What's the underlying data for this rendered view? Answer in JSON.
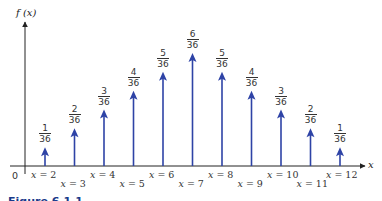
{
  "chart_data": {
    "type": "bar",
    "subtype": "stem-arrow",
    "title": "",
    "xlabel": "x",
    "ylabel": "f (x)",
    "origin_label": "0",
    "categories": [
      "x = 2",
      "x = 3",
      "x = 4",
      "x = 5",
      "x = 6",
      "x = 7",
      "x = 8",
      "x = 9",
      "x = 10",
      "x = 11",
      "x = 12"
    ],
    "x": [
      2,
      3,
      4,
      5,
      6,
      7,
      8,
      9,
      10,
      11,
      12
    ],
    "values": [
      0.02778,
      0.05556,
      0.08333,
      0.11111,
      0.13889,
      0.16667,
      0.13889,
      0.11111,
      0.08333,
      0.05556,
      0.02778
    ],
    "value_labels": [
      {
        "num": "1",
        "den": "36"
      },
      {
        "num": "2",
        "den": "36"
      },
      {
        "num": "3",
        "den": "36"
      },
      {
        "num": "4",
        "den": "36"
      },
      {
        "num": "5",
        "den": "36"
      },
      {
        "num": "6",
        "den": "36"
      },
      {
        "num": "5",
        "den": "36"
      },
      {
        "num": "4",
        "den": "36"
      },
      {
        "num": "3",
        "den": "36"
      },
      {
        "num": "2",
        "den": "36"
      },
      {
        "num": "1",
        "den": "36"
      }
    ],
    "ylim": [
      0,
      0.2
    ],
    "grid": false,
    "legend": null,
    "bar_color": "#2e43a6",
    "axis_color": "#222222"
  },
  "caption": "Figure 6.1.1"
}
